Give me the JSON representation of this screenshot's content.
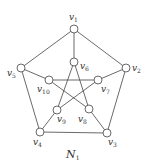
{
  "graph": {
    "caption": "N",
    "caption_sub": "1",
    "nodes": [
      {
        "id": "v1",
        "label": "v",
        "sub": "1",
        "x": 74,
        "y": 29,
        "lx": 69,
        "ly": 20
      },
      {
        "id": "v2",
        "label": "v",
        "sub": "2",
        "x": 126,
        "y": 68,
        "lx": 132,
        "ly": 71
      },
      {
        "id": "v3",
        "label": "v",
        "sub": "3",
        "x": 107,
        "y": 133,
        "lx": 108,
        "ly": 145
      },
      {
        "id": "v4",
        "label": "v",
        "sub": "4",
        "x": 40,
        "y": 132,
        "lx": 33,
        "ly": 145
      },
      {
        "id": "v5",
        "label": "v",
        "sub": "5",
        "x": 21,
        "y": 68,
        "lx": 7,
        "ly": 76
      },
      {
        "id": "v6",
        "label": "v",
        "sub": "6",
        "x": 74,
        "y": 62,
        "lx": 80,
        "ly": 69
      },
      {
        "id": "v7",
        "label": "v",
        "sub": "7",
        "x": 98,
        "y": 80,
        "lx": 101,
        "ly": 92
      },
      {
        "id": "v8",
        "label": "v",
        "sub": "8",
        "x": 89,
        "y": 109,
        "lx": 78,
        "ly": 122
      },
      {
        "id": "v9",
        "label": "v",
        "sub": "9",
        "x": 57,
        "y": 110,
        "lx": 57,
        "ly": 122
      },
      {
        "id": "v10",
        "label": "v",
        "sub": "10",
        "x": 49,
        "y": 80,
        "lx": 37,
        "ly": 92
      }
    ],
    "edges": [
      [
        "v1",
        "v2"
      ],
      [
        "v2",
        "v3"
      ],
      [
        "v3",
        "v4"
      ],
      [
        "v4",
        "v5"
      ],
      [
        "v5",
        "v1"
      ],
      [
        "v1",
        "v6"
      ],
      [
        "v2",
        "v7"
      ],
      [
        "v3",
        "v8"
      ],
      [
        "v4",
        "v9"
      ],
      [
        "v5",
        "v10"
      ],
      [
        "v6",
        "v8"
      ],
      [
        "v6",
        "v9"
      ],
      [
        "v7",
        "v9"
      ],
      [
        "v7",
        "v10"
      ],
      [
        "v8",
        "v10"
      ]
    ]
  }
}
